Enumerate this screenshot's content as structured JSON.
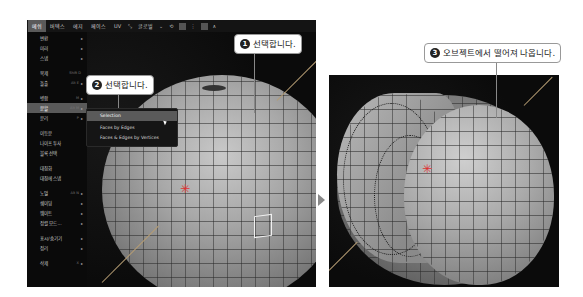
{
  "menubar": {
    "items": [
      "메쉬",
      "버텍스",
      "에지",
      "페이스",
      "UV"
    ],
    "active_index": 0,
    "transform_orientation": "글로벌"
  },
  "mesh_menu": {
    "items": [
      {
        "label": "변환",
        "shortcut": "",
        "submenu": true
      },
      {
        "label": "미러",
        "shortcut": "",
        "submenu": true
      },
      {
        "label": "스냅",
        "shortcut": "",
        "submenu": true
      },
      {
        "label": "복제",
        "shortcut": "Shift D",
        "submenu": false
      },
      {
        "label": "돌출",
        "shortcut": "Alt E",
        "submenu": true
      },
      {
        "label": "병합",
        "shortcut": "M",
        "submenu": true
      },
      {
        "label": "분할",
        "shortcut": "Alt M",
        "submenu": true,
        "highlighted": true
      },
      {
        "label": "분리",
        "shortcut": "P",
        "submenu": true
      },
      {
        "label": "이등분",
        "shortcut": "",
        "submenu": false
      },
      {
        "label": "나이프 투사",
        "shortcut": "",
        "submenu": false
      },
      {
        "label": "블록 선택",
        "shortcut": "",
        "submenu": false
      },
      {
        "label": "대칭화",
        "shortcut": "",
        "submenu": false
      },
      {
        "label": "대칭에 스냅",
        "shortcut": "",
        "submenu": false
      },
      {
        "label": "노멀",
        "shortcut": "Alt N",
        "submenu": true
      },
      {
        "label": "쉐이딩",
        "shortcut": "",
        "submenu": true
      },
      {
        "label": "웨이트",
        "shortcut": "",
        "submenu": true
      },
      {
        "label": "정렬 모드...",
        "shortcut": "",
        "submenu": true
      },
      {
        "label": "표시/숨기기",
        "shortcut": "",
        "submenu": true
      },
      {
        "label": "정리",
        "shortcut": "",
        "submenu": true
      },
      {
        "label": "삭제",
        "shortcut": "X",
        "submenu": true
      }
    ]
  },
  "submenu": {
    "items": [
      {
        "label": "Selection",
        "highlighted": true
      },
      {
        "label": "Faces by Edges",
        "highlighted": false
      },
      {
        "label": "Faces & Edges by Vertices",
        "highlighted": false
      }
    ]
  },
  "callouts": [
    {
      "number": "1",
      "text": "선택합니다."
    },
    {
      "number": "2",
      "text": "선택합니다."
    },
    {
      "number": "3",
      "text": "오브젝트에서 떨어져 나옵니다."
    }
  ]
}
